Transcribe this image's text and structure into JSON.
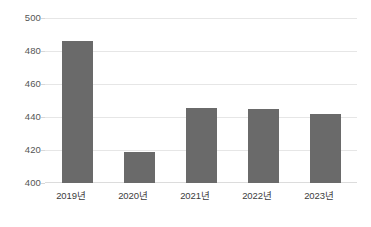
{
  "chart_data": {
    "type": "bar",
    "title": "",
    "subtitle": "",
    "xlabel": "",
    "ylabel": "",
    "categories": [
      "2019년",
      "2020년",
      "2021년",
      "2022년",
      "2023년"
    ],
    "values": [
      486,
      419,
      445.5,
      445,
      442
    ],
    "series": [
      {
        "name": "",
        "values": [
          486,
          419,
          445.5,
          445,
          442
        ]
      }
    ],
    "ylim": [
      400,
      500
    ],
    "yticks": [
      400,
      420,
      440,
      460,
      480,
      500
    ],
    "ytick_labels": [
      "400",
      "420",
      "440",
      "460",
      "480",
      "500"
    ],
    "grid": true,
    "grid_axis": "y",
    "legend": false,
    "legend_position": "none",
    "bar_color": "#6a6a6a",
    "grid_color": "#e6e6e6",
    "axis_label_color": "#555555",
    "background_color": "#ffffff"
  }
}
